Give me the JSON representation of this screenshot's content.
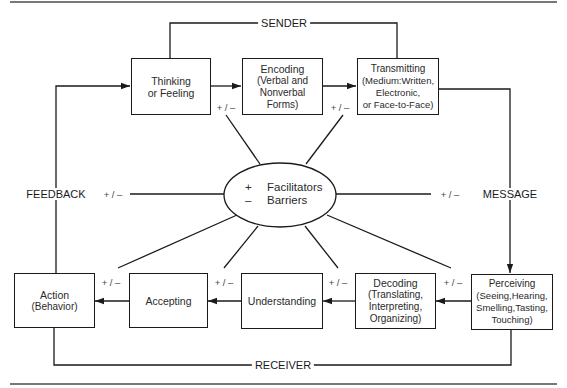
{
  "diagram": {
    "section_labels": {
      "sender": "SENDER",
      "receiver": "RECEIVER",
      "feedback": "FEEDBACK",
      "message": "MESSAGE"
    },
    "center": {
      "facilitators_symbol": "+",
      "facilitators": "Facilitators",
      "barriers_symbol": "–",
      "barriers": "Barriers"
    },
    "influence_marker": "+ / –",
    "boxes": {
      "thinking": {
        "line1": "Thinking",
        "line2": "or Feeling"
      },
      "encoding": {
        "line1": "Encoding",
        "line2": "(Verbal and",
        "line3": "Nonverbal",
        "line4": "Forms)"
      },
      "transmitting": {
        "line1": "Transmitting",
        "line2": "(Medium:Written,",
        "line3": "Electronic,",
        "line4": "or Face-to-Face)"
      },
      "perceiving": {
        "line1": "Perceiving",
        "line2": "(Seeing,Hearing,",
        "line3": "Smelling,Tasting,",
        "line4": "Touching)"
      },
      "decoding": {
        "line1": "Decoding",
        "line2": "(Translating,",
        "line3": "Interpreting,",
        "line4": "Organizing)"
      },
      "understanding": {
        "line1": "Understanding"
      },
      "accepting": {
        "line1": "Accepting"
      },
      "action": {
        "line1": "Action",
        "line2": "(Behavior)"
      }
    }
  }
}
